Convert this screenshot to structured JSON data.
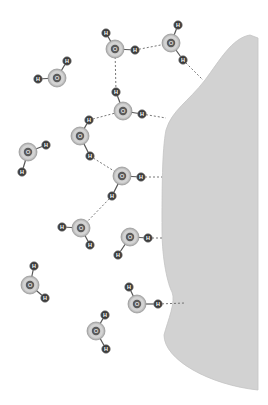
{
  "diagram": {
    "colors": {
      "surface": "#d2d2d2",
      "oxygen_ring": "#cfcfcf",
      "oxygen_core": "#5a5a5a",
      "hydrogen": "#3c3c3c",
      "bond": "#555555",
      "hbond": "#666666"
    },
    "atom_labels": {
      "oxygen": "O",
      "hydrogen": "H"
    },
    "surface_path": "M250,35 C232,38 220,60 205,80 C188,102 172,110 166,130 C162,150 162,190 162,230 C162,260 168,285 172,292 C176,302 168,320 164,335 C164,360 210,385 258,390 L258,38 Z",
    "molecules": [
      {
        "id": "m1",
        "o": [
          115,
          49
        ],
        "h": [
          [
            106,
            33
          ],
          [
            135,
            50
          ]
        ]
      },
      {
        "id": "m2",
        "o": [
          171,
          43
        ],
        "h": [
          [
            178,
            25
          ],
          [
            183,
            60
          ]
        ]
      },
      {
        "id": "m3",
        "o": [
          57,
          78
        ],
        "h": [
          [
            38,
            79
          ],
          [
            67,
            61
          ]
        ]
      },
      {
        "id": "m4",
        "o": [
          123,
          111
        ],
        "h": [
          [
            116,
            92
          ],
          [
            142,
            114
          ]
        ]
      },
      {
        "id": "m5",
        "o": [
          80,
          136
        ],
        "h": [
          [
            89,
            120
          ],
          [
            90,
            156
          ]
        ]
      },
      {
        "id": "m6",
        "o": [
          28,
          152
        ],
        "h": [
          [
            46,
            145
          ],
          [
            22,
            172
          ]
        ]
      },
      {
        "id": "m7",
        "o": [
          122,
          176
        ],
        "h": [
          [
            141,
            177
          ],
          [
            112,
            196
          ]
        ]
      },
      {
        "id": "m8",
        "o": [
          81,
          228
        ],
        "h": [
          [
            62,
            227
          ],
          [
            90,
            245
          ]
        ]
      },
      {
        "id": "m9",
        "o": [
          130,
          237
        ],
        "h": [
          [
            148,
            238
          ],
          [
            118,
            255
          ]
        ]
      },
      {
        "id": "m10",
        "o": [
          30,
          285
        ],
        "h": [
          [
            34,
            266
          ],
          [
            45,
            298
          ]
        ]
      },
      {
        "id": "m11",
        "o": [
          137,
          304
        ],
        "h": [
          [
            129,
            287
          ],
          [
            158,
            304
          ]
        ]
      },
      {
        "id": "m12",
        "o": [
          96,
          331
        ],
        "h": [
          [
            105,
            315
          ],
          [
            106,
            349
          ]
        ]
      }
    ],
    "hydrogen_bonds": [
      {
        "from": [
          135,
          50
        ],
        "to": [
          171,
          43
        ]
      },
      {
        "from": [
          183,
          60
        ],
        "to": [
          203,
          80
        ]
      },
      {
        "from": [
          115,
          49
        ],
        "to": [
          116,
          92
        ]
      },
      {
        "from": [
          142,
          114
        ],
        "to": [
          166,
          118
        ]
      },
      {
        "from": [
          89,
          120
        ],
        "to": [
          123,
          111
        ]
      },
      {
        "from": [
          90,
          156
        ],
        "to": [
          122,
          176
        ]
      },
      {
        "from": [
          141,
          177
        ],
        "to": [
          162,
          177
        ]
      },
      {
        "from": [
          112,
          196
        ],
        "to": [
          81,
          228
        ]
      },
      {
        "from": [
          148,
          238
        ],
        "to": [
          162,
          238
        ]
      },
      {
        "from": [
          158,
          304
        ],
        "to": [
          185,
          303
        ]
      }
    ]
  }
}
